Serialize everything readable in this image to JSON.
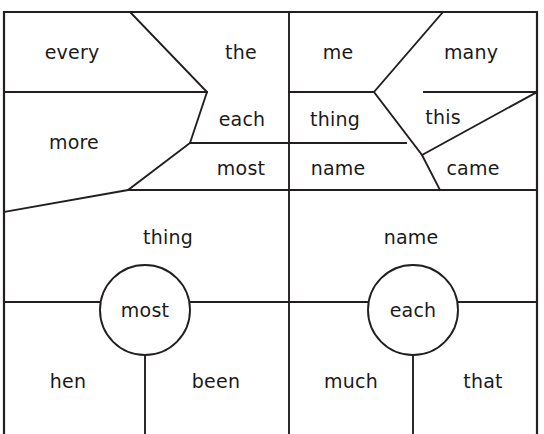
{
  "diagram": {
    "stroke_color": "#231f20",
    "background_color": "#ffffff",
    "width": 544,
    "height": 434,
    "regions": [
      {
        "id": "r1",
        "word": "every",
        "x": 72,
        "y": 52
      },
      {
        "id": "r2",
        "word": "the",
        "x": 241,
        "y": 52
      },
      {
        "id": "r3",
        "word": "me",
        "x": 338,
        "y": 52
      },
      {
        "id": "r4",
        "word": "many",
        "x": 471,
        "y": 52
      },
      {
        "id": "r5",
        "word": "more",
        "x": 74,
        "y": 142
      },
      {
        "id": "r6",
        "word": "each",
        "x": 242,
        "y": 119
      },
      {
        "id": "r7",
        "word": "thing",
        "x": 335,
        "y": 119
      },
      {
        "id": "r8",
        "word": "this",
        "x": 443,
        "y": 117
      },
      {
        "id": "r9",
        "word": "most",
        "x": 241,
        "y": 168
      },
      {
        "id": "r10",
        "word": "name",
        "x": 338,
        "y": 168
      },
      {
        "id": "r11",
        "word": "came",
        "x": 473,
        "y": 168
      },
      {
        "id": "r12",
        "word": "thing",
        "x": 168,
        "y": 237
      },
      {
        "id": "r13",
        "word": "name",
        "x": 411,
        "y": 237
      },
      {
        "id": "r14",
        "word": "hen",
        "x": 68,
        "y": 381
      },
      {
        "id": "r15",
        "word": "been",
        "x": 216,
        "y": 381
      },
      {
        "id": "r16",
        "word": "much",
        "x": 351,
        "y": 381
      },
      {
        "id": "r17",
        "word": "that",
        "x": 483,
        "y": 381
      }
    ],
    "nuclei": [
      {
        "id": "n1",
        "word": "most",
        "cx": 145,
        "cy": 310,
        "r": 45
      },
      {
        "id": "n2",
        "word": "each",
        "cx": 413,
        "cy": 310,
        "r": 45
      }
    ]
  }
}
